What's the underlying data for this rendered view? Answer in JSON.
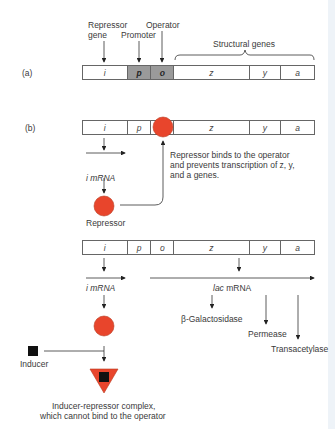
{
  "panel_a": {
    "label": "(a)",
    "annotations": {
      "repressor_gene": [
        "Repressor",
        "gene"
      ],
      "promoter": "Promoter",
      "operator": "Operator",
      "structural_genes": "Structural genes"
    },
    "genes": [
      "i",
      "p",
      "o",
      "z",
      "y",
      "a"
    ]
  },
  "panel_b": {
    "label": "(b)",
    "genes": [
      "i",
      "p",
      "o",
      "z",
      "y",
      "a"
    ],
    "i_mrna": "i mRNA",
    "repressor_label": "Repressor",
    "binding_note": [
      "Repressor binds to the operator",
      "and prevents transcription of z, y,",
      "and a genes."
    ]
  },
  "panel_c": {
    "genes": [
      "i",
      "p",
      "o",
      "z",
      "y",
      "a"
    ],
    "i_mrna": "i mRNA",
    "lac_mrna": "lac mRNA",
    "products": [
      "β-Galactosidase",
      "Permease",
      "Transacetylase"
    ],
    "inducer_label": "Inducer",
    "complex_caption": [
      "Inducer-repressor complex,",
      "which cannot bind to the operator"
    ]
  },
  "colors": {
    "repressor": "#e8452c",
    "shaded_region": "#9a9a9a",
    "outline": "#666666",
    "arrow": "#222222"
  }
}
